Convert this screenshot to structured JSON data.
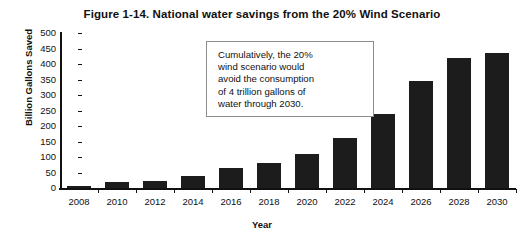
{
  "chart_data": {
    "type": "bar",
    "title": "Figure 1-14. National water savings from the 20% Wind Scenario",
    "xlabel": "Year",
    "ylabel": "Billion Gallons Saved",
    "categories": [
      "2008",
      "2010",
      "2012",
      "2014",
      "2016",
      "2018",
      "2020",
      "2022",
      "2024",
      "2026",
      "2028",
      "2030"
    ],
    "values": [
      8,
      18,
      22,
      38,
      65,
      80,
      110,
      160,
      240,
      345,
      420,
      435
    ],
    "ylim": [
      0,
      500
    ],
    "ytick_labels": [
      "500",
      "450",
      "400",
      "350",
      "300",
      "250",
      "200",
      "150",
      "100",
      "50",
      "0"
    ],
    "ytick_values": [
      500,
      450,
      400,
      350,
      300,
      250,
      200,
      150,
      100,
      50,
      0
    ],
    "ystep": 50,
    "grid": false,
    "legend": null,
    "bar_color": "#1c1c1c",
    "axis_color": "#111111",
    "background": "#ffffff",
    "annotations": [
      {
        "text": "Cumulatively, the 20% wind scenario would avoid the consumption of 4 trillion gallons of water through 2030.",
        "lines": [
          "Cumulatively, the 20%",
          "wind scenario would",
          "avoid the consumption",
          "of 4 trillion gallons of",
          "water through 2030."
        ]
      }
    ]
  }
}
